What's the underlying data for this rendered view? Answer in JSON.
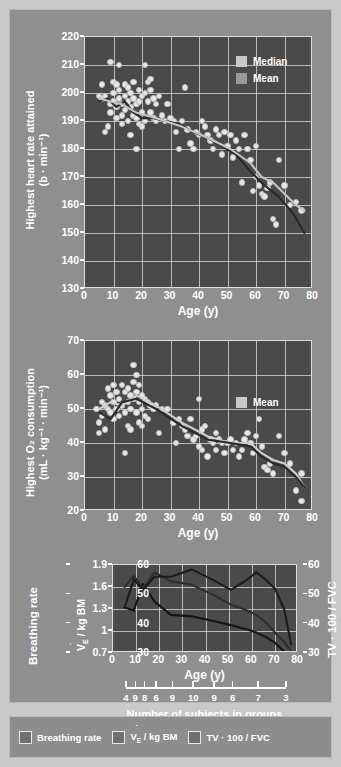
{
  "figure": {
    "background_color": "#8f8f8f",
    "plot_background_color": "#4a4a4a"
  },
  "bottom_legend": {
    "items": [
      {
        "label": "Breathing rate"
      },
      {
        "label": "V̇E / kg BM"
      },
      {
        "label": "TV · 100 / FVC"
      }
    ]
  },
  "subjects": {
    "caption": "Number of subjects in groups",
    "counts": [
      4,
      9,
      8,
      6,
      9,
      10,
      9,
      6,
      7,
      3
    ],
    "positions": [
      5,
      9,
      13,
      18,
      25,
      34,
      43,
      51,
      62,
      74
    ]
  },
  "chart_data": [
    {
      "type": "scatter",
      "id": "heart-rate",
      "title": "",
      "ylabel": "Highest heart rate attained (b · min⁻¹)",
      "ylabel_line1": "Highest heart rate attained",
      "ylabel_line2": "(b · min⁻¹)",
      "xlabel": "Age (y)",
      "xlim": [
        0,
        80
      ],
      "ylim": [
        130,
        220
      ],
      "xticks": [
        0,
        10,
        20,
        30,
        40,
        50,
        60,
        70,
        80
      ],
      "yticks": [
        130,
        140,
        150,
        160,
        170,
        180,
        190,
        200,
        210,
        220
      ],
      "grid": true,
      "legend": {
        "position": "top-right",
        "entries": [
          "Median",
          "Mean"
        ]
      },
      "points": [
        [
          5,
          199
        ],
        [
          6,
          203
        ],
        [
          6,
          198
        ],
        [
          7,
          199
        ],
        [
          7,
          186
        ],
        [
          8,
          188
        ],
        [
          9,
          211
        ],
        [
          9,
          196
        ],
        [
          9,
          193
        ],
        [
          10,
          204
        ],
        [
          10,
          200
        ],
        [
          10,
          197
        ],
        [
          11,
          203
        ],
        [
          11,
          195
        ],
        [
          11,
          191
        ],
        [
          12,
          210
        ],
        [
          12,
          201
        ],
        [
          12,
          198
        ],
        [
          13,
          196
        ],
        [
          13,
          192
        ],
        [
          13,
          189
        ],
        [
          14,
          203
        ],
        [
          14,
          199
        ],
        [
          14,
          194
        ],
        [
          15,
          202
        ],
        [
          15,
          197
        ],
        [
          15,
          190
        ],
        [
          16,
          200
        ],
        [
          16,
          195
        ],
        [
          16,
          185
        ],
        [
          17,
          204
        ],
        [
          17,
          198
        ],
        [
          17,
          192
        ],
        [
          18,
          196
        ],
        [
          18,
          191
        ],
        [
          18,
          180
        ],
        [
          19,
          201
        ],
        [
          19,
          197
        ],
        [
          19,
          189
        ],
        [
          20,
          199
        ],
        [
          20,
          193
        ],
        [
          20,
          188
        ],
        [
          21,
          210
        ],
        [
          21,
          200
        ],
        [
          21,
          190
        ],
        [
          22,
          204
        ],
        [
          22,
          197
        ],
        [
          23,
          205
        ],
        [
          23,
          201
        ],
        [
          23,
          193
        ],
        [
          24,
          198
        ],
        [
          24,
          191
        ],
        [
          25,
          196
        ],
        [
          25,
          190
        ],
        [
          26,
          199
        ],
        [
          27,
          192
        ],
        [
          28,
          190
        ],
        [
          29,
          196
        ],
        [
          30,
          191
        ],
        [
          31,
          190
        ],
        [
          32,
          186
        ],
        [
          33,
          180
        ],
        [
          34,
          190
        ],
        [
          35,
          202
        ],
        [
          36,
          187
        ],
        [
          37,
          182
        ],
        [
          38,
          180
        ],
        [
          39,
          186
        ],
        [
          40,
          185
        ],
        [
          41,
          190
        ],
        [
          42,
          188
        ],
        [
          43,
          185
        ],
        [
          44,
          183
        ],
        [
          45,
          180
        ],
        [
          46,
          187
        ],
        [
          47,
          185
        ],
        [
          48,
          178
        ],
        [
          49,
          186
        ],
        [
          50,
          181
        ],
        [
          51,
          185
        ],
        [
          52,
          177
        ],
        [
          53,
          183
        ],
        [
          54,
          180
        ],
        [
          55,
          168
        ],
        [
          56,
          185
        ],
        [
          57,
          180
        ],
        [
          58,
          176
        ],
        [
          59,
          165
        ],
        [
          60,
          181
        ],
        [
          60,
          170
        ],
        [
          61,
          167
        ],
        [
          62,
          164
        ],
        [
          63,
          163
        ],
        [
          64,
          166
        ],
        [
          65,
          168
        ],
        [
          66,
          155
        ],
        [
          67,
          153
        ],
        [
          68,
          176
        ],
        [
          70,
          167
        ],
        [
          72,
          160
        ],
        [
          74,
          161
        ],
        [
          76,
          158
        ]
      ],
      "series": [
        {
          "name": "Median",
          "color": "#2a2a2a",
          "x": [
            5,
            8,
            11,
            14,
            17,
            20,
            24,
            28,
            33,
            38,
            43,
            48,
            53,
            58,
            63,
            68,
            73,
            77
          ],
          "y": [
            197,
            198,
            195,
            197,
            193,
            191,
            191,
            190,
            189,
            186,
            184,
            181,
            178,
            172,
            167,
            163,
            157,
            150
          ]
        },
        {
          "name": "Mean",
          "color": "#c4c4c4",
          "x": [
            5,
            9,
            13,
            18,
            25,
            34,
            43,
            51,
            58,
            62,
            66,
            70,
            74,
            77
          ],
          "y": [
            198,
            197,
            196,
            193,
            191,
            188,
            184,
            180,
            175,
            170,
            168,
            164,
            160,
            158
          ]
        }
      ]
    },
    {
      "type": "scatter",
      "id": "o2-consumption",
      "title": "",
      "ylabel": "Highest O₂ consumption (mL · kg⁻¹ · min⁻¹)",
      "ylabel_line1": "Highest O₂ consumption",
      "ylabel_line2": "(mL · kg⁻¹ · min⁻¹)",
      "xlabel": "Age (y)",
      "xlim": [
        0,
        80
      ],
      "ylim": [
        20,
        70
      ],
      "xticks": [
        0,
        10,
        20,
        30,
        40,
        50,
        60,
        70,
        80
      ],
      "yticks": [
        20,
        30,
        40,
        50,
        60,
        70
      ],
      "grid": true,
      "legend": {
        "position": "center-right",
        "entries": [
          "Mean"
        ]
      },
      "points": [
        [
          4,
          50
        ],
        [
          5,
          46
        ],
        [
          5,
          43
        ],
        [
          6,
          52
        ],
        [
          6,
          48
        ],
        [
          7,
          51
        ],
        [
          7,
          44
        ],
        [
          8,
          56
        ],
        [
          8,
          50
        ],
        [
          9,
          54
        ],
        [
          9,
          49
        ],
        [
          10,
          57
        ],
        [
          10,
          52
        ],
        [
          10,
          47
        ],
        [
          11,
          55
        ],
        [
          11,
          50
        ],
        [
          12,
          53
        ],
        [
          12,
          48
        ],
        [
          13,
          57
        ],
        [
          13,
          51
        ],
        [
          14,
          55
        ],
        [
          14,
          49
        ],
        [
          14,
          37
        ],
        [
          15,
          56
        ],
        [
          15,
          52
        ],
        [
          15,
          45
        ],
        [
          16,
          54
        ],
        [
          16,
          50
        ],
        [
          16,
          44
        ],
        [
          17,
          63
        ],
        [
          17,
          58
        ],
        [
          17,
          53
        ],
        [
          18,
          60
        ],
        [
          18,
          55
        ],
        [
          18,
          49
        ],
        [
          19,
          57
        ],
        [
          19,
          52
        ],
        [
          19,
          46
        ],
        [
          20,
          54
        ],
        [
          20,
          50
        ],
        [
          20,
          45
        ],
        [
          21,
          53
        ],
        [
          21,
          48
        ],
        [
          22,
          52
        ],
        [
          22,
          47
        ],
        [
          23,
          51
        ],
        [
          24,
          50
        ],
        [
          25,
          51
        ],
        [
          26,
          43
        ],
        [
          27,
          50
        ],
        [
          29,
          50
        ],
        [
          31,
          46
        ],
        [
          32,
          40
        ],
        [
          33,
          47
        ],
        [
          34,
          45
        ],
        [
          35,
          44
        ],
        [
          36,
          42
        ],
        [
          37,
          47
        ],
        [
          38,
          41
        ],
        [
          39,
          42
        ],
        [
          40,
          53
        ],
        [
          40,
          39
        ],
        [
          41,
          44
        ],
        [
          41,
          38
        ],
        [
          42,
          45
        ],
        [
          43,
          36
        ],
        [
          44,
          41
        ],
        [
          45,
          40
        ],
        [
          46,
          43
        ],
        [
          46,
          38
        ],
        [
          47,
          41
        ],
        [
          48,
          40
        ],
        [
          49,
          37
        ],
        [
          50,
          40
        ],
        [
          51,
          41
        ],
        [
          52,
          38
        ],
        [
          53,
          40
        ],
        [
          54,
          36
        ],
        [
          55,
          38
        ],
        [
          56,
          41
        ],
        [
          57,
          43
        ],
        [
          58,
          40
        ],
        [
          59,
          37
        ],
        [
          60,
          42
        ],
        [
          61,
          47
        ],
        [
          62,
          39
        ],
        [
          63,
          33
        ],
        [
          64,
          32
        ],
        [
          65,
          34
        ],
        [
          66,
          31
        ],
        [
          68,
          42
        ],
        [
          70,
          37
        ],
        [
          72,
          34
        ],
        [
          74,
          26
        ],
        [
          76,
          31
        ],
        [
          76,
          23
        ]
      ],
      "series": [
        {
          "name": "Mean",
          "color": "#cdcdcd",
          "x": [
            5,
            9,
            13,
            18,
            25,
            34,
            43,
            51,
            58,
            62,
            66,
            70,
            74,
            77
          ],
          "y": [
            50,
            52,
            51,
            54,
            51,
            46,
            42,
            40,
            40,
            37,
            35,
            34,
            31,
            27
          ]
        },
        {
          "name": "Median",
          "color": "#2a2a2a",
          "x": [
            5,
            9,
            13,
            18,
            25,
            34,
            43,
            51,
            58,
            62,
            66,
            70,
            74,
            77
          ],
          "y": [
            49,
            47,
            52,
            53,
            50,
            45,
            41,
            40,
            39,
            36,
            34,
            33,
            30,
            27
          ]
        }
      ]
    },
    {
      "type": "line",
      "id": "breathing-mechanics",
      "title": "",
      "xlabel": "Age (y)",
      "ylabel_left": "Breathing rate",
      "ylabel_inner": "V̇E / kg BM",
      "ylabel_right": "TV · 100 / FVC",
      "xlim": [
        0,
        80
      ],
      "xticks": [
        0,
        10,
        20,
        30,
        40,
        50,
        60,
        70,
        80
      ],
      "left_ylim": [
        30,
        60
      ],
      "left_yticks": [
        30,
        40,
        50,
        60
      ],
      "inner_ylim": [
        0.7,
        1.9
      ],
      "inner_yticks": [
        0.7,
        1.0,
        1.3,
        1.6,
        1.9
      ],
      "right_ylim": [
        30,
        60
      ],
      "right_yticks": [
        30,
        40,
        50,
        60
      ],
      "grid": true,
      "series": [
        {
          "name": "Breathing rate",
          "axis": "left",
          "color": "#151515",
          "x": [
            5,
            9,
            13,
            18,
            25,
            34,
            43,
            51,
            58,
            62,
            66,
            70,
            74,
            77
          ],
          "y": [
            45.5,
            44.5,
            53.5,
            47.5,
            43.0,
            42.5,
            41.0,
            39.5,
            38.0,
            37.0,
            35.5,
            33.5,
            30.5,
            28.5
          ]
        },
        {
          "name": "V̇E / kg BM",
          "axis": "inner",
          "color": "#2e2e2e",
          "x": [
            5,
            9,
            13,
            18,
            25,
            34,
            43,
            51,
            58,
            62,
            66,
            70,
            74,
            77
          ],
          "y": [
            1.6,
            1.75,
            1.58,
            1.8,
            1.68,
            1.63,
            1.5,
            1.36,
            1.28,
            1.22,
            1.12,
            0.98,
            0.85,
            0.73
          ]
        },
        {
          "name": "TV · 100 / FVC",
          "axis": "right",
          "color": "#1c1c1c",
          "x": [
            5,
            9,
            13,
            18,
            25,
            34,
            43,
            51,
            58,
            62,
            66,
            70,
            74,
            77
          ],
          "y": [
            45.5,
            55.0,
            51.5,
            56.0,
            56.0,
            58.5,
            55.0,
            51.5,
            55.0,
            57.5,
            55.0,
            52.0,
            45.0,
            33.0
          ]
        }
      ]
    }
  ]
}
